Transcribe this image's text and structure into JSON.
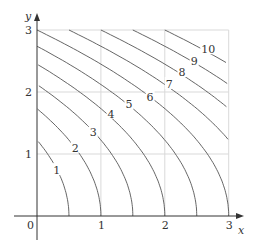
{
  "chart_data": {
    "type": "contour",
    "title": "",
    "xlabel": "x",
    "ylabel": "y",
    "xlim": [
      0,
      3
    ],
    "ylim": [
      0,
      3
    ],
    "x_ticks": [
      "0",
      "1",
      "2",
      "3"
    ],
    "y_ticks": [
      "1",
      "2",
      "3"
    ],
    "grid": true,
    "levels": [
      1,
      2,
      3,
      4,
      5,
      6,
      7,
      8,
      9,
      10
    ],
    "level_labels": [
      "1",
      "2",
      "3",
      "4",
      "5",
      "6",
      "7",
      "8",
      "9",
      "10"
    ],
    "level_curve_x_intercepts": [
      0.5,
      1.0,
      1.5,
      2.0,
      2.5,
      3.0,
      null,
      null,
      null,
      null
    ],
    "level_curve_y_intercepts": [
      1.22,
      1.73,
      2.12,
      2.45,
      2.74,
      3.0,
      null,
      null,
      null,
      null
    ],
    "label_positions": [
      [
        0.31,
        0.74
      ],
      [
        0.6,
        1.1
      ],
      [
        0.88,
        1.35
      ],
      [
        1.16,
        1.65
      ],
      [
        1.44,
        1.8
      ],
      [
        1.77,
        1.92
      ],
      [
        2.07,
        2.13
      ],
      [
        2.27,
        2.32
      ],
      [
        2.46,
        2.5
      ],
      [
        2.68,
        2.69
      ]
    ],
    "curve_color": "#555555",
    "grid_color": "#d9d9d9"
  },
  "axes": {
    "x_label": "x",
    "y_label": "y",
    "origin_label": "0"
  }
}
